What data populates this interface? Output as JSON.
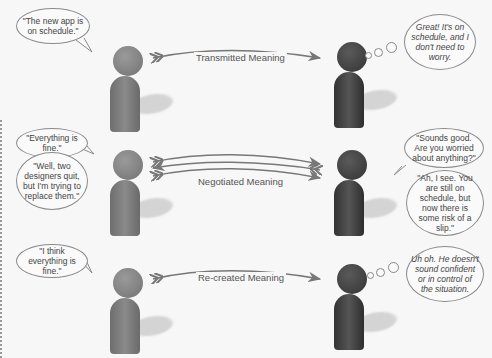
{
  "rows": [
    {
      "name": "transmitted",
      "label": "Transmitted Meaning",
      "speaker_bubbles": [
        "\"The new app is on schedule.\""
      ],
      "listener_bubbles": [
        "Great! It's on schedule, and I don't need to worry."
      ],
      "listener_bubble_type": "thought"
    },
    {
      "name": "negotiated",
      "label": "Negotiated Meaning",
      "speaker_bubbles": [
        "\"Everything is fine.\"",
        "\"Well, two designers quit, but I'm trying to replace them.\""
      ],
      "listener_bubbles": [
        "\"Sounds good. Are you worried about anything?\"",
        "\"Ah, I see. You are still on schedule, but now there is some risk of a slip.\""
      ],
      "listener_bubble_type": "speech"
    },
    {
      "name": "re-created",
      "label": "Re-created Meaning",
      "speaker_bubbles": [
        "\"I think everything is fine.\""
      ],
      "listener_bubbles": [
        "Uh oh. He doesn't sound confident or in control of the situation."
      ],
      "listener_bubble_type": "thought"
    }
  ],
  "colors": {
    "background": "#f7f7f7",
    "speaker": "#808080",
    "listener": "#3e3e3e",
    "arrow": "#777777"
  }
}
